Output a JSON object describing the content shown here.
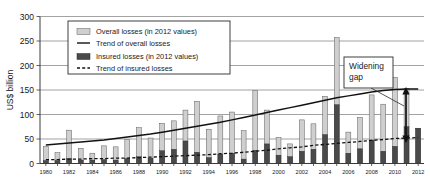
{
  "chart_data": {
    "type": "bar",
    "title": "",
    "xlabel": "",
    "ylabel": "US$ billion",
    "ylim": [
      0,
      300
    ],
    "yticks": [
      0,
      50,
      100,
      150,
      200,
      250,
      300
    ],
    "grid": true,
    "legend_position": "top-left",
    "x": [
      1980,
      1981,
      1982,
      1983,
      1984,
      1985,
      1986,
      1987,
      1988,
      1989,
      1990,
      1991,
      1992,
      1993,
      1994,
      1995,
      1996,
      1997,
      1998,
      1999,
      2000,
      2001,
      2002,
      2003,
      2004,
      2005,
      2006,
      2007,
      2008,
      2009,
      2010,
      2011,
      2012
    ],
    "xtick_labels": [
      "1980",
      "1982",
      "1984",
      "1986",
      "1988",
      "1990",
      "1992",
      "1994",
      "1996",
      "1998",
      "2000",
      "2002",
      "2004",
      "2006",
      "2008",
      "2010",
      "2012"
    ],
    "series": [
      {
        "name": "Overall losses (in 2012 values)",
        "values": [
          35,
          22,
          68,
          31,
          21,
          36,
          34,
          49,
          73,
          52,
          82,
          87,
          109,
          127,
          70,
          97,
          105,
          67,
          149,
          109,
          53,
          40,
          89,
          81,
          137,
          257,
          64,
          94,
          140,
          121,
          176,
          153,
          72
        ]
      },
      {
        "name": "Insured losses (in 2012 values)",
        "values": [
          6,
          6,
          10,
          7,
          7,
          8,
          7,
          10,
          14,
          11,
          26,
          29,
          46,
          23,
          12,
          19,
          21,
          9,
          27,
          40,
          17,
          14,
          25,
          29,
          59,
          120,
          21,
          30,
          48,
          25,
          35,
          75,
          72
        ]
      }
    ],
    "trend_overall": {
      "name": "Trend of overall losses",
      "values": [
        38,
        40,
        42,
        44,
        46,
        48,
        51,
        54,
        57,
        60,
        64,
        68,
        72,
        76,
        80,
        84,
        89,
        94,
        99,
        104,
        109,
        114,
        119,
        124,
        129,
        134,
        138,
        142,
        146,
        149,
        151,
        152,
        152
      ]
    },
    "trend_insured": {
      "name": "Trend of insured losses",
      "values": [
        8,
        8,
        9,
        9,
        10,
        10,
        11,
        11,
        12,
        13,
        14,
        15,
        16,
        17,
        18,
        20,
        21,
        23,
        25,
        27,
        30,
        32,
        34,
        37,
        39,
        41,
        43,
        45,
        47,
        49,
        51,
        52,
        53
      ]
    },
    "annotations": [
      {
        "name": "widening-gap",
        "text_line1": "Widening",
        "text_line2": "gap"
      }
    ],
    "colors": {
      "overall_bar": "#cfcfcf",
      "insured_bar": "#4a4a4a",
      "trend_line": "#121212",
      "grid": "#8c8c8c",
      "axis": "#3a3a3a",
      "background": "#ffffff"
    }
  },
  "legend": {
    "items": [
      {
        "label": "Overall losses (in 2012 values)",
        "marker": "swatch-light"
      },
      {
        "label": "Trend of overall losses",
        "marker": "line-solid"
      },
      {
        "label": "Insured losses (in 2012 values)",
        "marker": "swatch-dark"
      },
      {
        "label": "Trend of insured losses",
        "marker": "line-dashed"
      }
    ]
  },
  "axes": {
    "y_title": "US$ billion"
  }
}
